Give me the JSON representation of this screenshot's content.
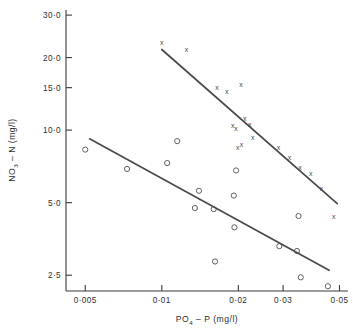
{
  "chart_data": {
    "type": "scatter",
    "title": "",
    "xlabel": "PO4 - P (mg/l)",
    "ylabel": "NO3 - N (mg/l)",
    "xlabel_parts": {
      "pre": "PO",
      "sub": "4",
      "post": " – P (mg/l)"
    },
    "ylabel_parts": {
      "pre": "NO",
      "sub": "3",
      "post": " – N (mg/l)"
    },
    "xscale": "log",
    "yscale": "log",
    "xlim": [
      0.0042,
      0.054
    ],
    "ylim": [
      2.15,
      31.5
    ],
    "grid": false,
    "legend": "none",
    "xticks": [
      0.005,
      0.01,
      0.02,
      0.03,
      0.05
    ],
    "xticklabels": [
      "0·005",
      "0·01",
      "0·02",
      "0·03",
      "0·05"
    ],
    "yticks": [
      2.5,
      5.0,
      10.0,
      15.0,
      20.0,
      30.0
    ],
    "yticklabels": [
      "2·5",
      "5·0",
      "10·0",
      "15·0",
      "20·0",
      "30·0"
    ],
    "series": [
      {
        "name": "upper-series",
        "marker": "x",
        "points": [
          [
            0.01,
            23.0
          ],
          [
            0.0125,
            21.5
          ],
          [
            0.0165,
            15.0
          ],
          [
            0.018,
            14.4
          ],
          [
            0.0205,
            15.4
          ],
          [
            0.019,
            10.4
          ],
          [
            0.0196,
            10.2
          ],
          [
            0.0212,
            11.2
          ],
          [
            0.0222,
            10.6
          ],
          [
            0.0228,
            9.3
          ],
          [
            0.0199,
            8.5
          ],
          [
            0.0206,
            8.7
          ],
          [
            0.0288,
            8.5
          ],
          [
            0.0318,
            7.7
          ],
          [
            0.035,
            7.0
          ],
          [
            0.0385,
            6.6
          ],
          [
            0.0425,
            5.7
          ],
          [
            0.0475,
            4.4
          ]
        ],
        "fit_line": {
          "x": [
            0.01,
            0.049
          ],
          "y": [
            21.6,
            4.95
          ]
        }
      },
      {
        "name": "lower-series",
        "marker": "o",
        "points": [
          [
            0.005,
            8.3
          ],
          [
            0.0073,
            6.9
          ],
          [
            0.0105,
            7.3
          ],
          [
            0.0115,
            9.0
          ],
          [
            0.014,
            5.6
          ],
          [
            0.0135,
            4.75
          ],
          [
            0.016,
            4.7
          ],
          [
            0.0162,
            2.85
          ],
          [
            0.0192,
            5.35
          ],
          [
            0.0196,
            6.8
          ],
          [
            0.0193,
            3.95
          ],
          [
            0.029,
            3.3
          ],
          [
            0.034,
            3.15
          ],
          [
            0.0345,
            4.4
          ],
          [
            0.0352,
            2.45
          ],
          [
            0.045,
            2.25
          ]
        ],
        "fit_line": {
          "x": [
            0.0052,
            0.0455
          ],
          "y": [
            9.2,
            2.62
          ]
        }
      }
    ]
  },
  "axes": {
    "x_tick_label_0": "0·005",
    "x_tick_label_1": "0·01",
    "x_tick_label_2": "0·02",
    "x_tick_label_3": "0·03",
    "x_tick_label_4": "0·05",
    "y_tick_label_0": "2·5",
    "y_tick_label_1": "5·0",
    "y_tick_label_2": "10·0",
    "y_tick_label_3": "15·0",
    "y_tick_label_4": "20·0",
    "y_tick_label_5": "30·0",
    "marker_cross_glyph": "x"
  },
  "colors": {
    "axis": "#3a3a3a",
    "marker": "#4f4f4f",
    "fit_line": "#4a4a4a",
    "background": "#ffffff"
  }
}
